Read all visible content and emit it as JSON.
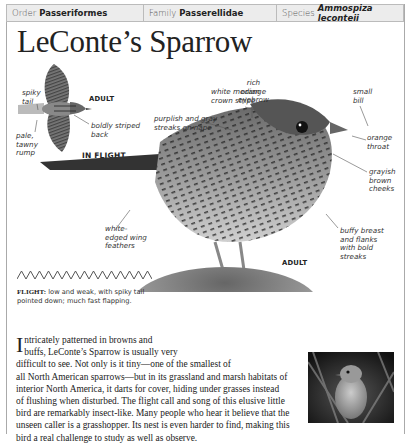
{
  "taxonomy": {
    "order_label": "Order",
    "order_value": "Passeriformes",
    "family_label": "Family",
    "family_value": "Passerellidae",
    "species_label": "Species",
    "species_value": "Ammospiza leconteii"
  },
  "title": "LeConte’s Sparrow",
  "flight_illustration": {
    "caption_adult": "ADULT",
    "caption_in_flight": "IN FLIGHT",
    "labels": {
      "spiky_tail": [
        "spiky",
        "tail"
      ],
      "pale_rump": [
        "pale,",
        "tawny",
        "rump"
      ],
      "striped_back": [
        "boldly striped",
        "back"
      ]
    }
  },
  "main_illustration": {
    "caption_adult": "ADULT",
    "labels": {
      "eyebrow": [
        "rich",
        "orange",
        "eyebrow"
      ],
      "bill": [
        "small",
        "bill"
      ],
      "crown": [
        "white median",
        "crown stripe"
      ],
      "nape": [
        "purplish and gray",
        "streaks on nape"
      ],
      "throat": [
        "orange",
        "throat"
      ],
      "cheeks": [
        "grayish",
        "brown",
        "cheeks"
      ],
      "wing": [
        "white-",
        "edged wing",
        "feathers"
      ],
      "breast": [
        "buffy breast",
        "and flanks",
        "with bold",
        "streaks"
      ]
    }
  },
  "flight_pattern": {
    "icon": "zigzag-flight-pattern-icon",
    "label": "FLIGHT:",
    "text": "low and weak, with spiky tail pointed down; much fast flapping."
  },
  "description": {
    "dropcap": "I",
    "lines": [
      "ntricately patterned in browns and",
      "buffs, LeConte’s Sparrow is usually very",
      "difficult to see. Not only is it tiny—one of the smallest of",
      "all North American sparrows—but in its grassland and marsh habitats of",
      "interior North America, it darts for cover, hiding under grasses instead",
      "of flushing when disturbed. The flight call and song of this elusive little",
      "bird are remarkably insect-like. Many people who hear it believe that the",
      "unseen caller is a grasshopper. Its nest is even harder to find, making this",
      "bird a real challenge to study as well as observe."
    ]
  },
  "photo": {
    "alt": "photo-of-sparrow-in-grass"
  }
}
